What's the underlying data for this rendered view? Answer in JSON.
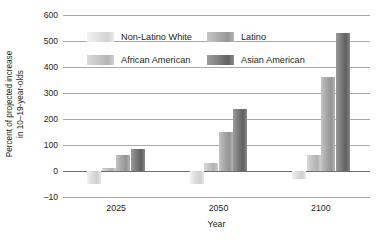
{
  "chart_data": {
    "type": "bar",
    "title": "",
    "xlabel": "Year",
    "ylabel": "Percent of projected increase in 10–19-year-olds",
    "ylabel_line1": "Percent of projected increase",
    "ylabel_line2": "in 10–19-year-olds",
    "categories": [
      "2025",
      "2050",
      "2100"
    ],
    "series": [
      {
        "name": "Non-Latino White",
        "values": [
          -5,
          -5,
          -3
        ],
        "color": "#dcdcdc"
      },
      {
        "name": "African American",
        "values": [
          10,
          30,
          60
        ],
        "color": "#c2c2c2"
      },
      {
        "name": "Latino",
        "values": [
          60,
          150,
          360
        ],
        "color": "#a8a8a8"
      },
      {
        "name": "Asian American",
        "values": [
          85,
          240,
          530
        ],
        "color": "#7d7d7d"
      }
    ],
    "ytick_labels": [
      "600",
      "500",
      "400",
      "300",
      "200",
      "100",
      "0",
      "−10"
    ],
    "ytick_values": [
      600,
      500,
      400,
      300,
      200,
      100,
      0,
      -10
    ],
    "ylim": [
      -10,
      600
    ],
    "grid": true,
    "legend_position": "upper-left-inside",
    "legend_order": [
      "Non-Latino White",
      "Latino",
      "African American",
      "Asian American"
    ]
  },
  "axes": {
    "y": {
      "ticks": [
        {
          "label": "600"
        },
        {
          "label": "500"
        },
        {
          "label": "400"
        },
        {
          "label": "300"
        },
        {
          "label": "200"
        },
        {
          "label": "100"
        },
        {
          "label": "0"
        },
        {
          "label": "−10"
        }
      ]
    },
    "x": {
      "title": "Year",
      "ticks": [
        {
          "label": "2025"
        },
        {
          "label": "2050"
        },
        {
          "label": "2100"
        }
      ]
    }
  },
  "legend": {
    "entries": [
      {
        "label": "Non-Latino White"
      },
      {
        "label": "Latino"
      },
      {
        "label": "African American"
      },
      {
        "label": "Asian American"
      }
    ]
  }
}
